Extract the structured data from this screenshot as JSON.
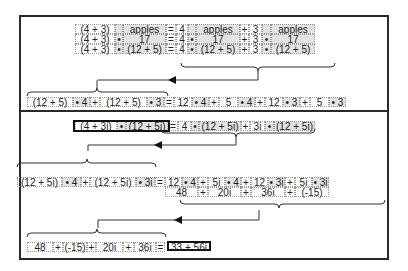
{
  "colors": {
    "frame": "#2a2a2a",
    "shade": "#e3e3e3",
    "dotted": "#9a9a9a"
  },
  "top": {
    "rows": [
      [
        "(4 + 3)",
        "",
        "apples",
        "=",
        "4",
        "",
        "apples",
        "+",
        "3",
        "",
        "apples"
      ],
      [
        "(4 + 3)",
        "•",
        "17",
        "=",
        "4",
        "•",
        "17",
        "+",
        "3",
        "•",
        "17"
      ],
      [
        "(4 + 3)",
        "•",
        "(12 + 5)",
        "=",
        "4",
        "•",
        "(12 + 5)",
        "+",
        "3",
        "•",
        "(12 + 5)"
      ]
    ],
    "expanded": [
      "(12 + 5)",
      "• 4",
      "+",
      "(12 + 5)",
      "• 3",
      "=",
      "12",
      "• 4",
      "+",
      "5",
      "• 4",
      "+",
      "12",
      "• 3",
      "+",
      "5",
      "• 3"
    ]
  },
  "bottom": {
    "row1": [
      "(4 + 3i)",
      "•",
      "(12 + 5i)",
      "=",
      "4",
      "•",
      "(12 + 5i)",
      "+",
      "3i",
      "•",
      "(12 + 5i)"
    ],
    "row2": [
      "(12 + 5i)",
      "• 4",
      "+",
      "(12 + 5i)",
      "• 3i",
      "=",
      "12",
      "• 4",
      "+",
      "5i",
      "• 4",
      "+",
      "12",
      "• 3i",
      "+",
      "5i",
      "• 3i"
    ],
    "row3": [
      "48",
      "+",
      "20i",
      "+",
      "36i",
      "+",
      "(-15)"
    ],
    "row4": [
      "48",
      "+",
      "(-15)",
      "+",
      "20i",
      "+",
      "36i",
      "="
    ],
    "result": "33 + 56i"
  }
}
